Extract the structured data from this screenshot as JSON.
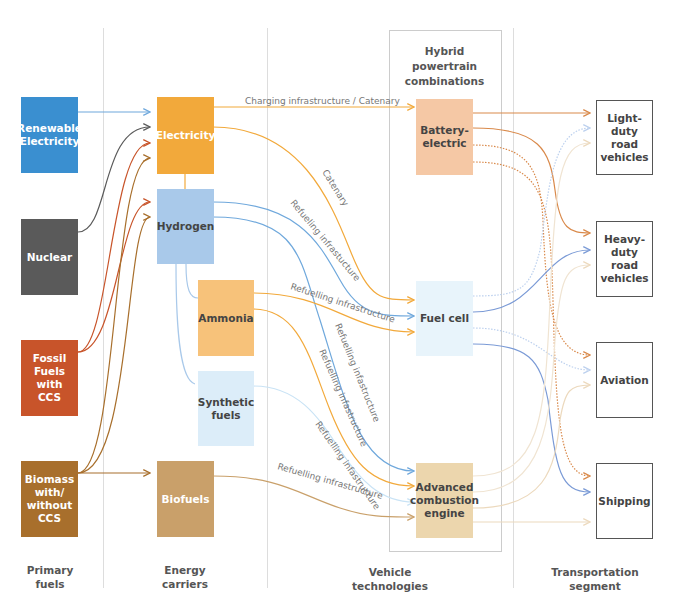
{
  "columns": {
    "primary_fuels": "Primary\nfuels",
    "energy_carriers": "Energy\ncarriers",
    "vehicle_technologies": "Vehicle\ntechnologies",
    "transportation_segment": "Transportation\nsegment"
  },
  "hybrid_label": "Hybrid\npowertrain\ncombinations",
  "primary_fuels": [
    {
      "label": "Renewable\nElectricity",
      "color": "#3a8fd0"
    },
    {
      "label": "Nuclear",
      "color": "#5a5a5a"
    },
    {
      "label": "Fossil Fuels\nwith\nCCS",
      "color": "#c8542a"
    },
    {
      "label": "Biomass\nwith/\nwithout\nCCS",
      "color": "#a86f2c"
    }
  ],
  "energy_carriers": [
    {
      "label": "Electricity",
      "color": "#f2a93b"
    },
    {
      "label": "Hydrogen",
      "color": "#a9c9ea"
    },
    {
      "label": "Ammonia",
      "color": "#f7c27a"
    },
    {
      "label": "Synthetic\nfuels",
      "color": "#dcedf9"
    },
    {
      "label": "Biofuels",
      "color": "#c9a06a"
    }
  ],
  "vehicle_technologies": [
    {
      "label": "Battery-\nelectric",
      "color": "#f5c8a5"
    },
    {
      "label": "Fuel cell",
      "color": "#e8f4fb"
    },
    {
      "label": "Advanced\ncombustion\nengine",
      "color": "#ecd6ad"
    }
  ],
  "transportation_segments": [
    {
      "label": "Light-duty\nroad\nvehicles"
    },
    {
      "label": "Heavy-duty\nroad\nvehicles"
    },
    {
      "label": "Aviation"
    },
    {
      "label": "Shipping"
    }
  ],
  "link_labels": {
    "charging": "Charging infrastructure / Catenary",
    "catenary": "Catenary",
    "h2_refuel_fc": "Refueling infrastucture",
    "nh3_refuel_fc": "Refuelling infrastructure",
    "h2_refuel_ice": "Refuelling infastructure",
    "nh3_refuel_ice": "Refuelling infastructure",
    "syn_refuel_ice": "Refuelling infastructure",
    "bio_refuel_ice": "Refuelling infrastructure"
  },
  "colors": {
    "blue_link": "#6fa8dc",
    "orange_link": "#f2a93b",
    "battery_out": "#d9894a",
    "fc_out": "#7a9ad6",
    "ice_out": "#f0dcc0",
    "divider": "#dddddd"
  }
}
